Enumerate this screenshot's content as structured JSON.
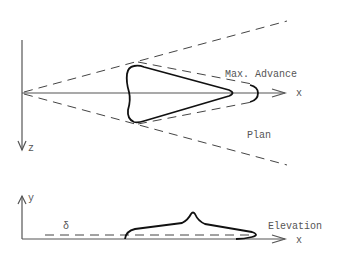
{
  "plan": {
    "title": "Plan",
    "x_axis_label": "x",
    "z_axis_label": "z",
    "annotation": "Max. Advance"
  },
  "elevation": {
    "title": "Elevation",
    "x_axis_label": "x",
    "y_axis_label": "y",
    "delta_label": "δ"
  },
  "colors": {
    "line": "#111111",
    "axis": "#555555",
    "text": "#555555"
  }
}
